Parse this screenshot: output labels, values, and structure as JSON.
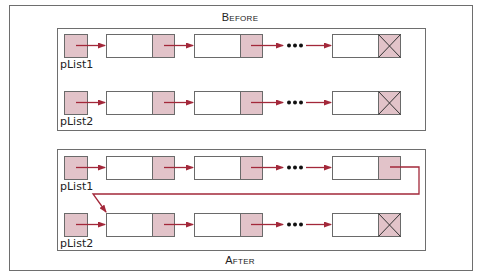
{
  "diagram": {
    "colors": {
      "frame": "#6e6e6e",
      "node_border": "#6a6a6a",
      "pointer_fill": "#e2c3c9",
      "arrow": "#a3283a",
      "text": "#222222"
    },
    "panels": [
      {
        "label": "Before",
        "lists": [
          {
            "pointer_label": "pList1",
            "nodes": [
              "node",
              "node",
              "...",
              "last-null"
            ]
          },
          {
            "pointer_label": "pList2",
            "nodes": [
              "node",
              "node",
              "...",
              "last-null"
            ]
          }
        ]
      },
      {
        "label": "After",
        "lists": [
          {
            "pointer_label": "pList1",
            "nodes": [
              "node",
              "node",
              "...",
              "last-linked-to-pList2-first"
            ]
          },
          {
            "pointer_label": "pList2",
            "nodes": [
              "node",
              "node",
              "...",
              "last-null"
            ]
          }
        ]
      }
    ],
    "ellipsis": "•••"
  }
}
